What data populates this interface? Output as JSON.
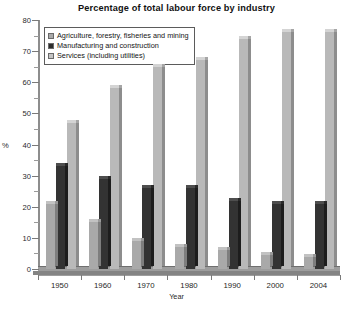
{
  "chart_data": {
    "type": "bar",
    "title": "Percentage of total labour force by industry",
    "xlabel": "Year",
    "ylabel": "%",
    "ylim": [
      0,
      80
    ],
    "ytick_step": 10,
    "yticks": [
      0,
      10,
      20,
      30,
      40,
      50,
      60,
      70,
      80
    ],
    "grid": false,
    "legend_position": "top-left",
    "categories": [
      "1950",
      "1960",
      "1970",
      "1980",
      "1990",
      "2000",
      "2004"
    ],
    "series": [
      {
        "name": "Agriculture, forestry, fisheries and mining",
        "color": "#a9a9a9",
        "values": [
          21,
          15,
          9,
          7,
          6,
          4.5,
          4
        ]
      },
      {
        "name": "Manufacturing and construction",
        "color": "#2d2d2d",
        "values": [
          33,
          29,
          26,
          26,
          22,
          21,
          21
        ]
      },
      {
        "name": "Services (including utilities)",
        "color": "#c4c4c4",
        "values": [
          47,
          58,
          65,
          67,
          74,
          76,
          76
        ]
      }
    ]
  },
  "axis": {
    "y_title": "%",
    "x_title": "Year"
  }
}
